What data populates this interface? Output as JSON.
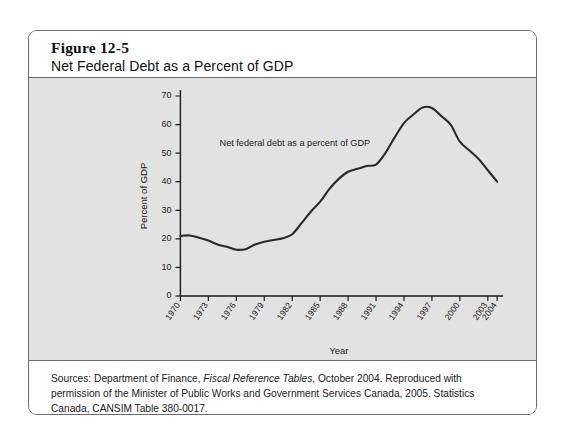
{
  "figure": {
    "number": "Figure 12-5",
    "title": "Net Federal Debt as a Percent of GDP",
    "source_prefix": "Sources: Department of Finance, ",
    "source_italic": "Fiscal Reference Tables",
    "source_suffix": ", October 2004. Reproduced with permission of the Minister of Public Works and Government Services Canada, 2005. Statistics Canada, CANSIM Table 380-0017."
  },
  "chart_data": {
    "type": "line",
    "title": "Net Federal Debt as a Percent of GDP",
    "xlabel": "Year",
    "ylabel": "Percent of GDP",
    "annotation": "Net federal debt as a percent of GDP",
    "xlim": [
      1970,
      2004
    ],
    "ylim": [
      0,
      70
    ],
    "ytick_values": [
      0,
      10,
      20,
      30,
      40,
      50,
      60,
      70
    ],
    "ytick_labels": [
      "0",
      "10",
      "20",
      "30",
      "40",
      "50",
      "60",
      "70"
    ],
    "xtick_values": [
      1970,
      1973,
      1976,
      1979,
      1982,
      1985,
      1988,
      1991,
      1994,
      1997,
      2000,
      2003,
      2004
    ],
    "xtick_labels": [
      "1970",
      "1973",
      "1976",
      "1979",
      "1982",
      "1985",
      "1988",
      "1991",
      "1994",
      "1997",
      "2000",
      "2003",
      "2004"
    ],
    "grid": false,
    "legend": "none",
    "series": [
      {
        "name": "Net federal debt as a percent of GDP",
        "color": "#2a2a2a",
        "x": [
          1970,
          1971,
          1972,
          1973,
          1974,
          1975,
          1976,
          1977,
          1978,
          1979,
          1980,
          1981,
          1982,
          1983,
          1984,
          1985,
          1986,
          1987,
          1988,
          1989,
          1990,
          1991,
          1992,
          1993,
          1994,
          1995,
          1996,
          1997,
          1998,
          1999,
          2000,
          2001,
          2002,
          2003,
          2004
        ],
        "values": [
          21.0,
          21.2,
          20.4,
          19.4,
          18.0,
          17.2,
          16.2,
          16.4,
          18.0,
          19.0,
          19.6,
          20.2,
          21.6,
          25.5,
          29.5,
          33.0,
          37.5,
          41.0,
          43.5,
          44.5,
          45.5,
          46.0,
          50.0,
          55.5,
          60.5,
          63.5,
          66.0,
          65.8,
          63.0,
          60.0,
          54.0,
          51.0,
          48.0,
          44.0,
          40.0
        ]
      }
    ]
  }
}
